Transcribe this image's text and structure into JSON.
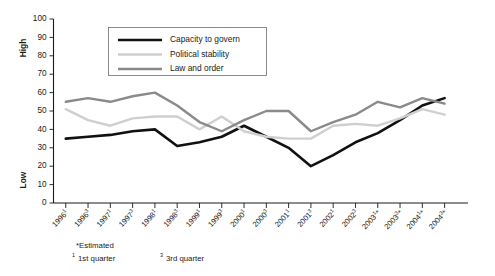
{
  "chart_data": {
    "type": "line",
    "title": "",
    "subtitle": "",
    "xlabel": "",
    "ylabel": "",
    "ylim": [
      0,
      100
    ],
    "ytick_step": 10,
    "yticks": [
      0,
      10,
      20,
      30,
      40,
      50,
      60,
      70,
      80,
      90,
      100
    ],
    "y_axis_end_labels": {
      "high": "High",
      "low": "Low"
    },
    "grid": false,
    "legend_position": "top-center",
    "categories": [
      "1996¹",
      "1996³",
      "1997¹",
      "1997³",
      "1998¹",
      "1998³",
      "1999¹",
      "1999³",
      "2000¹",
      "2000³",
      "2001¹",
      "2001³",
      "2002¹",
      "2002³",
      "2003¹*",
      "2003³*",
      "2004¹*",
      "2004³*"
    ],
    "category_parts": [
      {
        "year": "1996",
        "sup": "1",
        "est": ""
      },
      {
        "year": "1996",
        "sup": "3",
        "est": ""
      },
      {
        "year": "1997",
        "sup": "1",
        "est": ""
      },
      {
        "year": "1997",
        "sup": "3",
        "est": ""
      },
      {
        "year": "1998",
        "sup": "1",
        "est": ""
      },
      {
        "year": "1998",
        "sup": "3",
        "est": ""
      },
      {
        "year": "1999",
        "sup": "1",
        "est": ""
      },
      {
        "year": "1999",
        "sup": "3",
        "est": ""
      },
      {
        "year": "2000",
        "sup": "1",
        "est": ""
      },
      {
        "year": "2000",
        "sup": "3",
        "est": ""
      },
      {
        "year": "2001",
        "sup": "1",
        "est": ""
      },
      {
        "year": "2001",
        "sup": "3",
        "est": ""
      },
      {
        "year": "2002",
        "sup": "1",
        "est": ""
      },
      {
        "year": "2002",
        "sup": "3",
        "est": ""
      },
      {
        "year": "2003",
        "sup": "1",
        "est": "*"
      },
      {
        "year": "2003",
        "sup": "3",
        "est": "*"
      },
      {
        "year": "2004",
        "sup": "1",
        "est": "*"
      },
      {
        "year": "2004",
        "sup": "3",
        "est": "*"
      }
    ],
    "series": [
      {
        "name": "Capacity to govern",
        "color": "#111111",
        "width": 2.6,
        "values": [
          35,
          36,
          37,
          39,
          40,
          31,
          33,
          36,
          42,
          36,
          30,
          20,
          26,
          33,
          38,
          45,
          53,
          57
        ]
      },
      {
        "name": "Political stability",
        "color": "#cfcfcf",
        "width": 2.4,
        "values": [
          51,
          45,
          42,
          46,
          47,
          47,
          40,
          47,
          39,
          36,
          35,
          35,
          42,
          43,
          42,
          46,
          51,
          48
        ]
      },
      {
        "name": "Law and order",
        "color": "#8a8a8a",
        "width": 2.4,
        "values": [
          55,
          57,
          55,
          58,
          60,
          53,
          44,
          39,
          45,
          50,
          50,
          39,
          44,
          48,
          55,
          52,
          57,
          54
        ]
      }
    ],
    "annotations": {
      "footnotes": [
        {
          "marker": "*",
          "text": "Estimated"
        },
        {
          "marker": "1",
          "text": "1st quarter"
        },
        {
          "marker": "3",
          "text": "3rd quarter"
        }
      ]
    }
  },
  "legend": {
    "items": [
      {
        "label": "Capacity to govern"
      },
      {
        "label": "Political stability"
      },
      {
        "label": "Law and order"
      }
    ]
  },
  "footnotes": {
    "estimated_marker": "*",
    "estimated_text": "Estimated",
    "q1_marker": "1",
    "q1_text": "1st quarter",
    "q3_marker": "3",
    "q3_text": "3rd quarter"
  },
  "colors": {
    "capacity_to_govern": "#111111",
    "political_stability": "#cfcfcf",
    "law_and_order": "#8a8a8a",
    "axis": "#1a1a1a",
    "legend_border": "#6e6e6e",
    "background": "#ffffff"
  }
}
